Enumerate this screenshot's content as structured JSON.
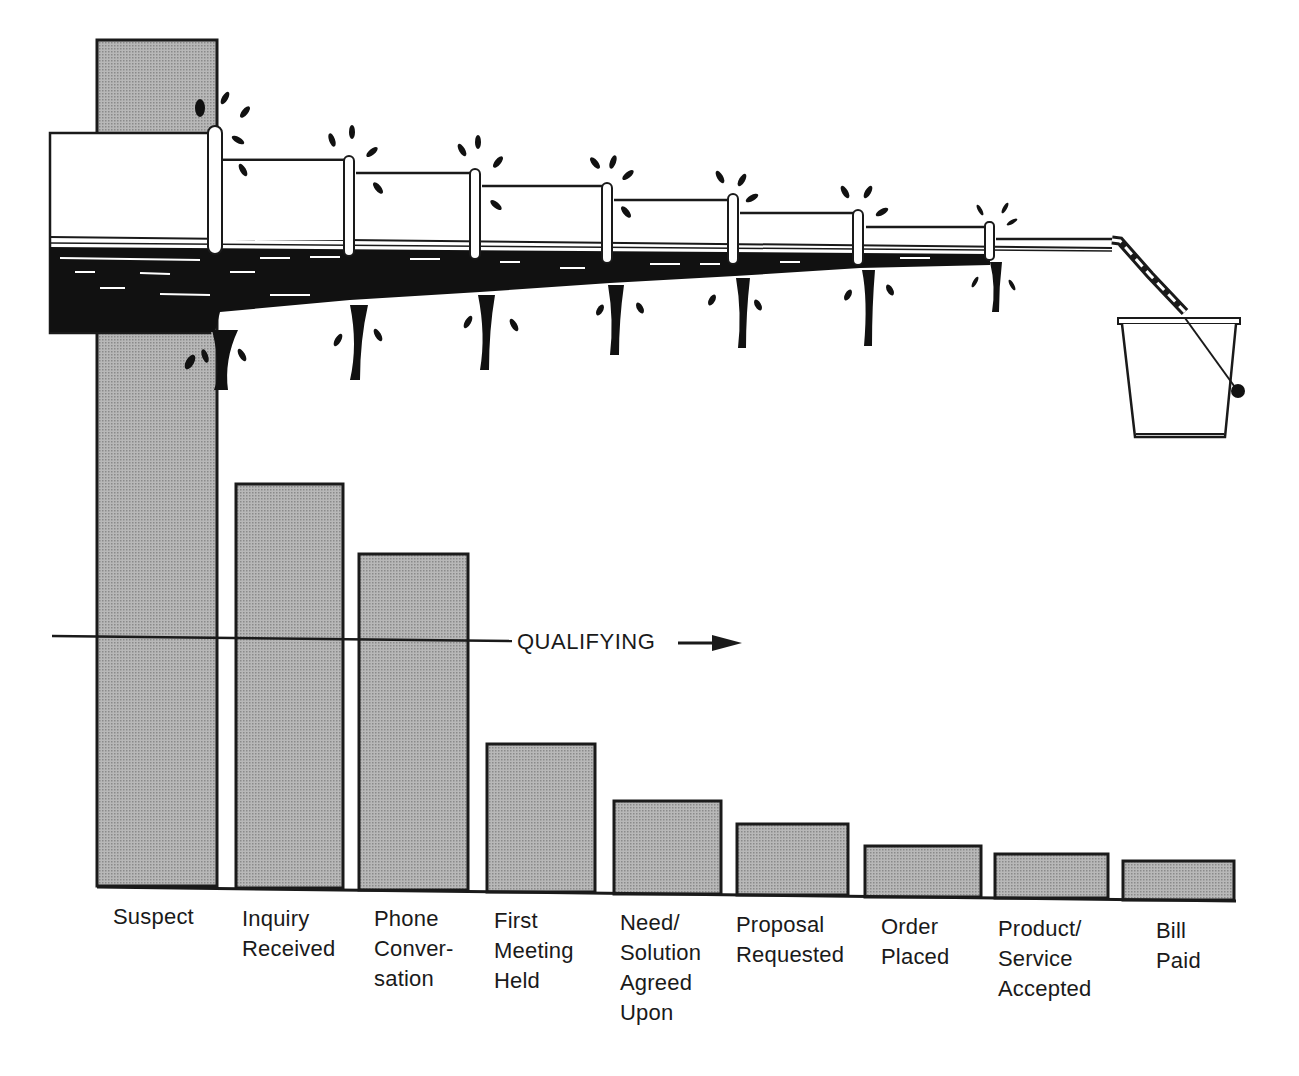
{
  "chart_data": {
    "type": "bar",
    "title": "",
    "xlabel": "",
    "ylabel": "",
    "grid": false,
    "legend": null,
    "categories": [
      "Suspect",
      "Inquiry Received",
      "Phone Conversation",
      "First Meeting Held",
      "Need/Solution Agreed Upon",
      "Proposal Requested",
      "Order Placed",
      "Product/Service Accepted",
      "Bill Paid"
    ],
    "values": [
      100,
      47,
      39,
      17,
      11,
      8,
      5,
      4,
      3
    ],
    "value_units": "relative bar height (percent of Suspect bar, estimated)",
    "annotations": [
      {
        "text": "QUALIFYING",
        "type": "arrow",
        "direction": "right",
        "y_relative": 29
      }
    ],
    "illustration": "leaky pipeline narrowing left to right, leaking at each joint and pouring into a bucket"
  },
  "labels": [
    {
      "text": "Suspect",
      "x": 113,
      "y": 902
    },
    {
      "text": "Inquiry\nReceived",
      "x": 242,
      "y": 904
    },
    {
      "text": "Phone\nConver-\nsation",
      "x": 374,
      "y": 904
    },
    {
      "text": "First\nMeeting\nHeld",
      "x": 494,
      "y": 906
    },
    {
      "text": "Need/\nSolution\nAgreed\nUpon",
      "x": 620,
      "y": 908
    },
    {
      "text": "Proposal\nRequested",
      "x": 736,
      "y": 910
    },
    {
      "text": "Order\nPlaced",
      "x": 881,
      "y": 912
    },
    {
      "text": "Product/\nService\nAccepted",
      "x": 998,
      "y": 914
    },
    {
      "text": "Bill\nPaid",
      "x": 1156,
      "y": 916
    }
  ],
  "bars": [
    {
      "x": 97,
      "top": 40,
      "w": 120,
      "bottom": 886
    },
    {
      "x": 236,
      "top": 484,
      "w": 107,
      "bottom": 888
    },
    {
      "x": 359,
      "top": 554,
      "w": 109,
      "bottom": 890
    },
    {
      "x": 487,
      "top": 744,
      "w": 108,
      "bottom": 892
    },
    {
      "x": 614,
      "top": 801,
      "w": 107,
      "bottom": 894
    },
    {
      "x": 737,
      "top": 824,
      "w": 111,
      "bottom": 895
    },
    {
      "x": 865,
      "top": 846,
      "w": 116,
      "bottom": 897
    },
    {
      "x": 995,
      "top": 854,
      "w": 113,
      "bottom": 898
    },
    {
      "x": 1123,
      "top": 861,
      "w": 111,
      "bottom": 900
    }
  ],
  "qualifying_label": "QUALIFYING",
  "colors": {
    "bar_fill": "#a9a9a9",
    "ink": "#1a1a1a",
    "background": "#ffffff"
  }
}
